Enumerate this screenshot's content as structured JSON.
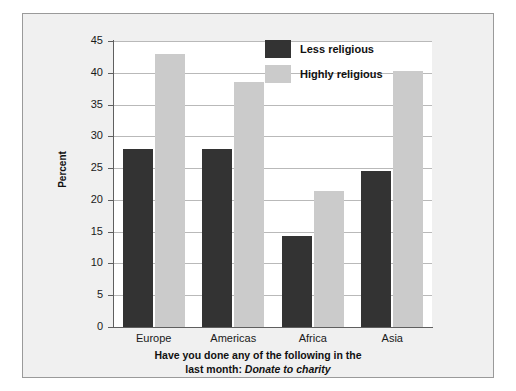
{
  "chart_data": {
    "type": "bar",
    "title": "",
    "categories": [
      "Europe",
      "Americas",
      "Africa",
      "Asia"
    ],
    "series": [
      {
        "name": "Less religious",
        "color": "#333333",
        "values": [
          28,
          28,
          14.3,
          24.5
        ]
      },
      {
        "name": "Highly religious",
        "color": "#cbcbcb",
        "values": [
          43,
          38.5,
          21.4,
          40.3
        ]
      }
    ],
    "xlabel": "",
    "ylabel": "Percent",
    "ylim": [
      0,
      45
    ],
    "ytick_step": 5,
    "yticks": [
      "45",
      "40",
      "35",
      "30",
      "25",
      "20",
      "15",
      "10",
      "5",
      "0"
    ],
    "grid": true,
    "legend_position": "top-right",
    "caption_line1": "Have you done any of the following in the",
    "caption_line2_prefix": "last month: ",
    "caption_line2_emphasis": "Donate to charity"
  },
  "legend": {
    "items": [
      {
        "label": "Less religious"
      },
      {
        "label": "Highly religious"
      }
    ]
  },
  "axes": {
    "y_label": "Percent"
  }
}
